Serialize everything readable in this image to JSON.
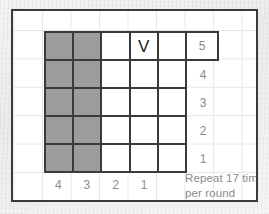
{
  "chart_data": {
    "type": "table",
    "grid": {
      "columns": 5,
      "rows": 5,
      "cells": [
        [
          {
            "fill": "shaded",
            "symbol": ""
          },
          {
            "fill": "shaded",
            "symbol": ""
          },
          {
            "fill": "white",
            "symbol": ""
          },
          {
            "fill": "white",
            "symbol": "V"
          },
          {
            "fill": "white",
            "symbol": ""
          }
        ],
        [
          {
            "fill": "shaded",
            "symbol": ""
          },
          {
            "fill": "shaded",
            "symbol": ""
          },
          {
            "fill": "white",
            "symbol": ""
          },
          {
            "fill": "white",
            "symbol": ""
          },
          {
            "fill": "white",
            "symbol": ""
          }
        ],
        [
          {
            "fill": "shaded",
            "symbol": ""
          },
          {
            "fill": "shaded",
            "symbol": ""
          },
          {
            "fill": "white",
            "symbol": ""
          },
          {
            "fill": "white",
            "symbol": ""
          },
          {
            "fill": "white",
            "symbol": ""
          }
        ],
        [
          {
            "fill": "shaded",
            "symbol": ""
          },
          {
            "fill": "shaded",
            "symbol": ""
          },
          {
            "fill": "white",
            "symbol": ""
          },
          {
            "fill": "white",
            "symbol": ""
          },
          {
            "fill": "white",
            "symbol": ""
          }
        ],
        [
          {
            "fill": "shaded",
            "symbol": ""
          },
          {
            "fill": "shaded",
            "symbol": ""
          },
          {
            "fill": "white",
            "symbol": ""
          },
          {
            "fill": "white",
            "symbol": ""
          },
          {
            "fill": "white",
            "symbol": ""
          }
        ]
      ]
    },
    "row_labels": [
      "5",
      "4",
      "3",
      "2",
      "1"
    ],
    "column_labels": [
      "4",
      "3",
      "2",
      "1",
      ""
    ],
    "annotations": [
      "Repeat 17 times",
      "per round"
    ],
    "colors": {
      "shaded_cell": "#9c9c9c",
      "white_cell": "#ffffff",
      "grid_line": "#3a3a3a",
      "background_grid_line": "#e8e8e8",
      "label_text": "#8a8a8a",
      "symbol_text": "#222222"
    }
  }
}
